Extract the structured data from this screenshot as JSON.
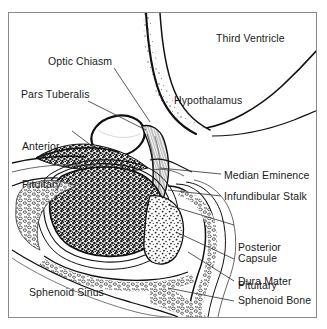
{
  "figure": {
    "background_color": "#ffffff",
    "ink_color": "#1a1a1a",
    "frame_color": "#8a8a8a"
  },
  "labels": [
    {
      "id": "third-ventricle",
      "text": "Third Ventricle",
      "x": 216,
      "y": 38,
      "lines": [
        "Third Ventricle"
      ]
    },
    {
      "id": "optic-chiasm",
      "text": "Optic Chiasm",
      "x": 48,
      "y": 61,
      "lines": [
        "Optic Chiasm"
      ]
    },
    {
      "id": "hypothalamus",
      "text": "Hypothalamus",
      "x": 174,
      "y": 100,
      "lines": [
        "Hypothalamus"
      ]
    },
    {
      "id": "pars-tuberalis",
      "text": "Pars Tuberalis",
      "x": 21,
      "y": 94,
      "lines": [
        "Pars Tuberalis"
      ]
    },
    {
      "id": "anterior-pituitary",
      "text": "Anterior Pituitary",
      "x": 22,
      "y": 121,
      "lines": [
        "Anterior",
        "Pituitary"
      ]
    },
    {
      "id": "median-eminence",
      "text": "Median Eminence",
      "x": 224,
      "y": 175,
      "lines": [
        "Median Eminence"
      ]
    },
    {
      "id": "infundibular-stalk",
      "text": "Infundibular Stalk",
      "x": 224,
      "y": 196,
      "lines": [
        "Infundibular Stalk"
      ]
    },
    {
      "id": "posterior-pituitary",
      "text": "Posterior Pituitary",
      "x": 238,
      "y": 222,
      "lines": [
        "Posterior",
        "Pituitary"
      ]
    },
    {
      "id": "capsule",
      "text": "Capsule",
      "x": 238,
      "y": 258,
      "lines": [
        "Capsule"
      ]
    },
    {
      "id": "dura-mater",
      "text": "Dura Mater",
      "x": 238,
      "y": 281,
      "lines": [
        "Dura Mater"
      ]
    },
    {
      "id": "sphenoid-bone",
      "text": "Sphenoid Bone",
      "x": 238,
      "y": 300,
      "lines": [
        "Sphenoid Bone"
      ]
    },
    {
      "id": "sphenoid-sinus",
      "text": "Sphenoid Sinus",
      "x": 29,
      "y": 292,
      "lines": [
        "Sphenoid Sinus"
      ]
    }
  ],
  "leader_lines": [
    {
      "id": "leader-optic-chiasm",
      "from": [
        114,
        68
      ],
      "to": [
        150,
        122
      ]
    },
    {
      "id": "leader-pars-tuberalis",
      "from": [
        88,
        101
      ],
      "to": [
        146,
        130
      ]
    },
    {
      "id": "leader-anterior-pituitary",
      "from": [
        72,
        131
      ],
      "to": [
        100,
        152
      ]
    },
    {
      "id": "leader-median-eminence",
      "from": [
        221,
        174
      ],
      "to": [
        160,
        168
      ]
    },
    {
      "id": "leader-infundibular-stalk",
      "from": [
        221,
        196
      ],
      "to": [
        168,
        190
      ]
    },
    {
      "id": "leader-posterior-pituitary",
      "from": [
        234,
        225
      ],
      "to": [
        168,
        205
      ]
    },
    {
      "id": "leader-capsule",
      "from": [
        234,
        259
      ],
      "to": [
        176,
        232
      ]
    },
    {
      "id": "leader-dura-mater",
      "from": [
        234,
        281
      ],
      "to": [
        188,
        252
      ]
    },
    {
      "id": "leader-sphenoid-bone",
      "from": [
        234,
        301
      ],
      "to": [
        168,
        288
      ]
    }
  ]
}
